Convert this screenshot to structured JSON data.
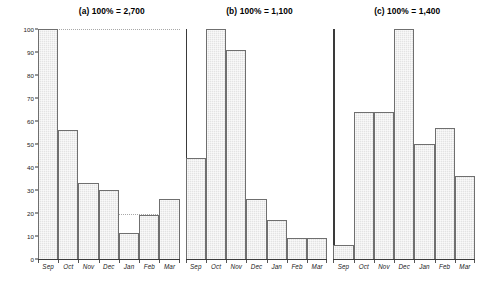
{
  "figure": {
    "ylabel": "% of peak count",
    "yticks": [
      "0",
      "10",
      "20",
      "30",
      "40",
      "50",
      "60",
      "70",
      "80",
      "90",
      "100"
    ]
  },
  "chart_data": {
    "type": "bar",
    "title": "",
    "xlabel": "",
    "ylabel": "% of peak count",
    "ylim": [
      0,
      100
    ],
    "ytick_step": 10,
    "grid": "dotted horizontal gridlines at 20 and 100",
    "categories": [
      "Sep",
      "Oct",
      "Nov",
      "Dec",
      "Jan",
      "Feb",
      "Mar"
    ],
    "panels": [
      {
        "label": "(a)",
        "title": "(a) 100% = 2,700",
        "total": "2,700",
        "values": [
          100,
          56,
          33,
          30,
          11,
          19,
          26
        ]
      },
      {
        "label": "(b)",
        "title": "(b) 100% = 1,100",
        "total": "1,100",
        "values": [
          44,
          100,
          91,
          26,
          17,
          9,
          9
        ]
      },
      {
        "label": "(c)",
        "title": "(c) 100% = 1,400",
        "total": "1,400",
        "values": [
          6,
          64,
          64,
          100,
          50,
          57,
          36
        ]
      }
    ]
  },
  "colors": {
    "bar_fill": "#e3e3e3",
    "bar_stroke": "#6f6f6f",
    "axis": "#3a3a3a",
    "text": "#000000"
  }
}
